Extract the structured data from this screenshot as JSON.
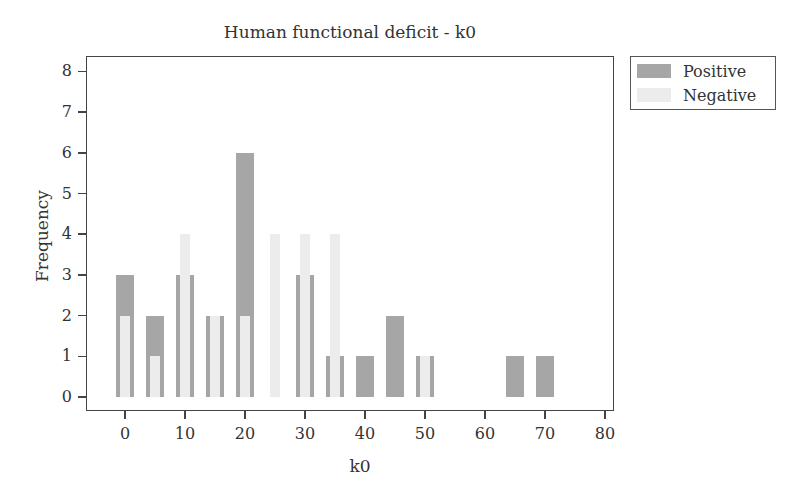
{
  "chart_data": {
    "type": "bar",
    "title": "Human functional deficit - k0",
    "xlabel": "k0",
    "ylabel": "Frequency",
    "xlim": [
      -6,
      82
    ],
    "ylim": [
      -0.3,
      8.4
    ],
    "x_ticks": [
      0,
      10,
      20,
      30,
      40,
      50,
      60,
      70,
      80
    ],
    "y_ticks": [
      0,
      1,
      2,
      3,
      4,
      5,
      6,
      7,
      8
    ],
    "grid": false,
    "legend_position": "outside right top",
    "categories": [
      0,
      5,
      10,
      15,
      20,
      25,
      30,
      35,
      40,
      45,
      50,
      55,
      60,
      65,
      70
    ],
    "series": [
      {
        "name": "Positive",
        "color": "#a6a6a6",
        "values": [
          3,
          2,
          3,
          2,
          6,
          0,
          3,
          1,
          1,
          2,
          1,
          0,
          0,
          1,
          1
        ]
      },
      {
        "name": "Negative",
        "color": "#ececec",
        "values": [
          2,
          1,
          4,
          2,
          2,
          4,
          4,
          4,
          0,
          0,
          1,
          0,
          0,
          0,
          0
        ]
      }
    ]
  },
  "legend": {
    "items": [
      {
        "label": "Positive",
        "color": "#a6a6a6"
      },
      {
        "label": "Negative",
        "color": "#ececec"
      }
    ]
  }
}
